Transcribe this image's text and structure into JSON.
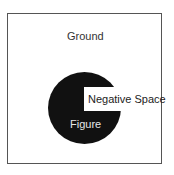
{
  "diagram": {
    "labels": {
      "ground": "Ground",
      "negative_space": "Negative Space",
      "figure": "Figure"
    },
    "colors": {
      "ground": "#ffffff",
      "figure": "#111111",
      "frame_border": "#555555",
      "figure_text": "#e6e6e6",
      "ground_text": "#333333"
    }
  }
}
